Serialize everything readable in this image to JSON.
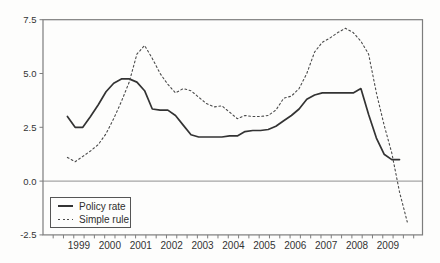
{
  "chart_data": {
    "type": "line",
    "title": "",
    "xlabel": "",
    "ylabel": "",
    "x_frequency": "quarterly",
    "x_start_year": 1999,
    "x_year_labels": [
      "1999",
      "2000",
      "2001",
      "2002",
      "2003",
      "2004",
      "2005",
      "2006",
      "2007",
      "2008",
      "2009"
    ],
    "y_ticks": [
      {
        "label": "7.5",
        "value": 7.5
      },
      {
        "label": "5.0",
        "value": 5.0
      },
      {
        "label": "2.5",
        "value": 2.5
      },
      {
        "label": "0.0",
        "value": 0.0
      },
      {
        "label": "-2.5",
        "value": -2.5
      }
    ],
    "ylim": [
      -2.5,
      7.5
    ],
    "grid": "zero-line-only",
    "legend_position": "bottom-left",
    "series": [
      {
        "name": "Policy rate",
        "style": "solid",
        "color": "#333333",
        "values": [
          3.0,
          2.5,
          2.5,
          3.0,
          3.55,
          4.15,
          4.55,
          4.75,
          4.75,
          4.6,
          4.2,
          3.35,
          3.3,
          3.3,
          3.05,
          2.6,
          2.15,
          2.05,
          2.05,
          2.05,
          2.05,
          2.1,
          2.1,
          2.3,
          2.35,
          2.35,
          2.4,
          2.55,
          2.8,
          3.05,
          3.35,
          3.8,
          4.0,
          4.1,
          4.1,
          4.1,
          4.1,
          4.1,
          4.3,
          3.1,
          2.0,
          1.25,
          1.0,
          1.0
        ]
      },
      {
        "name": "Simple rule",
        "style": "dotted",
        "color": "#4a4a4a",
        "values": [
          1.1,
          0.9,
          1.15,
          1.4,
          1.7,
          2.2,
          2.9,
          3.7,
          4.6,
          5.9,
          6.3,
          5.7,
          5.0,
          4.5,
          4.1,
          4.3,
          4.2,
          3.9,
          3.6,
          3.45,
          3.5,
          3.2,
          2.9,
          3.05,
          3.0,
          3.0,
          3.05,
          3.3,
          3.85,
          3.95,
          4.3,
          5.0,
          6.0,
          6.45,
          6.65,
          6.9,
          7.1,
          6.9,
          6.5,
          5.9,
          4.1,
          2.6,
          1.3,
          -0.5,
          -1.9
        ]
      }
    ],
    "frame_color": "#7d7d7d",
    "zero_line_color": "#8f8f8f",
    "text_color": "#333333"
  }
}
